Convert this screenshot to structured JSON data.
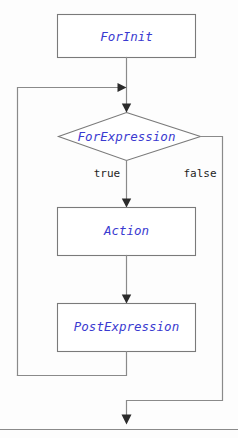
{
  "diagram": {
    "type": "flowchart",
    "colors": {
      "node_text": "#3a3ad0",
      "edge_label_text": "#1d1d1d",
      "line": "#8a8a8a",
      "box_stroke": "#7a7a7a",
      "box_fill": "#ffffff",
      "arrow_fill": "#2b2b2b",
      "background": "#fdfdfd"
    },
    "nodes": [
      {
        "id": "for-init",
        "shape": "rectangle",
        "label": "ForInit"
      },
      {
        "id": "for-expression",
        "shape": "diamond",
        "label": "ForExpression"
      },
      {
        "id": "action",
        "shape": "rectangle",
        "label": "Action"
      },
      {
        "id": "post-expression",
        "shape": "rectangle",
        "label": "PostExpression"
      }
    ],
    "edge_labels": [
      {
        "id": "true-label",
        "label": "true"
      },
      {
        "id": "false-label",
        "label": "false"
      }
    ]
  }
}
